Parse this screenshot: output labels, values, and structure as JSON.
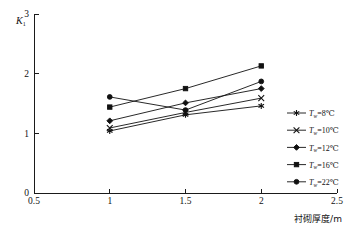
{
  "chart_data": {
    "type": "line",
    "title": "",
    "subtitle": "",
    "xlabel": "衬砌厚度/m",
    "ylabel": "K1",
    "ylabel_base": "K",
    "ylabel_sub": "1",
    "x": [
      1,
      1.5,
      2
    ],
    "xlim": [
      0.5,
      2.5
    ],
    "ylim": [
      0,
      3
    ],
    "xticks": [
      "0.5",
      "1",
      "1.5",
      "2",
      "2.5"
    ],
    "xtick_values": [
      0.5,
      1,
      1.5,
      2,
      2.5
    ],
    "yticks": [
      "0",
      "1",
      "2",
      "3"
    ],
    "ytick_values": [
      0,
      1,
      2,
      3
    ],
    "grid": false,
    "legend_position": "right",
    "series": [
      {
        "name": "Tw=8℃",
        "label_base": "T",
        "label_sub": "w",
        "label_tail": "=8℃",
        "marker": "asterisk",
        "color": "#111111",
        "values": [
          1.04,
          1.31,
          1.46
        ]
      },
      {
        "name": "Tw=10℃",
        "label_base": "T",
        "label_sub": "w",
        "label_tail": "=10℃",
        "marker": "x",
        "color": "#111111",
        "values": [
          1.09,
          1.35,
          1.59
        ]
      },
      {
        "name": "Tw=12℃",
        "label_base": "T",
        "label_sub": "w",
        "label_tail": "=12℃",
        "marker": "diamond",
        "color": "#111111",
        "values": [
          1.21,
          1.51,
          1.75
        ]
      },
      {
        "name": "Tw=16℃",
        "label_base": "T",
        "label_sub": "w",
        "label_tail": "=16℃",
        "marker": "square",
        "color": "#111111",
        "values": [
          1.44,
          1.75,
          2.13
        ]
      },
      {
        "name": "Tw=22℃",
        "label_base": "T",
        "label_sub": "w",
        "label_tail": "=22℃",
        "marker": "circle",
        "color": "#111111",
        "values": [
          1.61,
          1.39,
          1.87
        ]
      }
    ]
  }
}
